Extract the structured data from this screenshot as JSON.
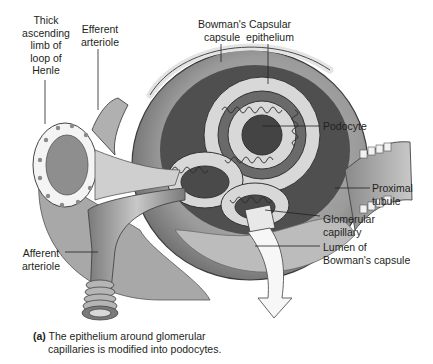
{
  "figure": {
    "labels": [
      {
        "id": "thick-ascending-limb",
        "text": "Thick\nascending\nlimb of\nloop of\nHenle"
      },
      {
        "id": "efferent-arteriole",
        "text": "Efferent\narteriole"
      },
      {
        "id": "bowmans-capsule",
        "text": "Bowman's\ncapsule"
      },
      {
        "id": "capsular-epithelium",
        "text": "Capsular\nepithelium"
      },
      {
        "id": "podocyte",
        "text": "Podocyte"
      },
      {
        "id": "proximal-tubule",
        "text": "Proximal\ntubule"
      },
      {
        "id": "glomerular-capillary",
        "text": "Glomerular\ncapillary"
      },
      {
        "id": "lumen-bowmans-capsule",
        "text": "Lumen of\nBowman's capsule"
      },
      {
        "id": "afferent-arteriole",
        "text": "Afferent\narteriole"
      }
    ],
    "caption": {
      "tag": "(a)",
      "line1": "The epithelium around glomerular",
      "line2": "capillaries is modified into podocytes."
    },
    "colors": {
      "text": "#231f20",
      "leader": "#231f20",
      "capsule_dark": "#5e5e5e",
      "capsule_mid": "#9a9a9a",
      "capsule_light": "#d4d4d4",
      "cell_fill": "#f2f2f2"
    }
  }
}
